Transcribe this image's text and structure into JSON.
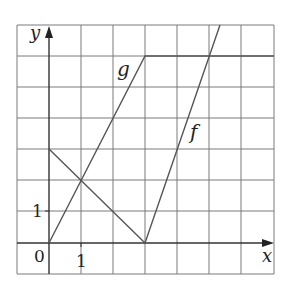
{
  "diagram": {
    "type": "function-graphs",
    "axes": {
      "x_label": "x",
      "y_label": "y",
      "origin_label": "0",
      "x_tick_label": "1",
      "y_tick_label": "1",
      "x_range": [
        -1,
        7
      ],
      "y_range": [
        -1,
        7
      ],
      "grid": true
    },
    "functions": [
      {
        "name": "f",
        "label": "f",
        "points": [
          [
            0,
            3
          ],
          [
            3,
            0
          ],
          [
            5.333,
            7
          ]
        ]
      },
      {
        "name": "g",
        "label": "g",
        "points": [
          [
            0,
            0
          ],
          [
            3,
            6
          ],
          [
            7,
            6
          ]
        ]
      }
    ]
  }
}
